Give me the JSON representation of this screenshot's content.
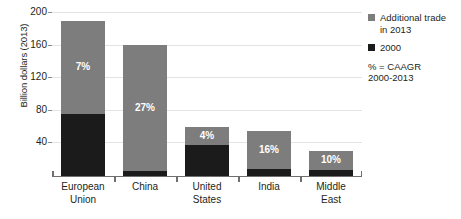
{
  "chart_data": {
    "type": "bar",
    "title": "",
    "xlabel": "",
    "ylabel": "Billion dollars (2013)",
    "ylim": [
      0,
      200
    ],
    "yticks": [
      40,
      80,
      120,
      160,
      200
    ],
    "grid": true,
    "stacked": true,
    "legend_position": "right",
    "categories": [
      "European Union",
      "China",
      "United States",
      "India",
      "Middle East"
    ],
    "series": [
      {
        "name": "2000",
        "color": "#1b1b1b",
        "values": [
          76,
          5,
          38,
          8,
          7
        ]
      },
      {
        "name": "Additional trade in 2013",
        "color": "#7d7d7d",
        "values": [
          114,
          155,
          22,
          47,
          23
        ]
      }
    ],
    "totals": [
      190,
      160,
      60,
      55,
      30
    ],
    "annotations": [
      "7%",
      "27%",
      "4%",
      "16%",
      "10%"
    ],
    "annotation_note": "% = CAAGR 2000-2013"
  },
  "axis": {
    "ylabel": "Billion dollars (2013)",
    "yticks": [
      {
        "value": 200,
        "label": "200"
      },
      {
        "value": 160,
        "label": "160"
      },
      {
        "value": 120,
        "label": "120"
      },
      {
        "value": 80,
        "label": "80"
      },
      {
        "value": 40,
        "label": "40"
      }
    ],
    "categories": [
      {
        "line1": "European",
        "line2": "Union"
      },
      {
        "line1": "China",
        "line2": ""
      },
      {
        "line1": "United",
        "line2": "States"
      },
      {
        "line1": "India",
        "line2": ""
      },
      {
        "line1": "Middle",
        "line2": "East"
      }
    ]
  },
  "bars": [
    {
      "category": "European Union",
      "total": 190,
      "base": 76,
      "top": 114,
      "pct": "7%"
    },
    {
      "category": "China",
      "total": 160,
      "base": 5,
      "top": 155,
      "pct": "27%"
    },
    {
      "category": "United States",
      "total": 60,
      "base": 38,
      "top": 22,
      "pct": "4%"
    },
    {
      "category": "India",
      "total": 55,
      "base": 8,
      "top": 47,
      "pct": "16%"
    },
    {
      "category": "Middle East",
      "total": 30,
      "base": 7,
      "top": 23,
      "pct": "10%"
    }
  ],
  "legend": {
    "items": [
      {
        "label_line1": "Additional trade",
        "label_line2": "in 2013",
        "color": "#7d7d7d"
      },
      {
        "label_line1": "2000",
        "label_line2": "",
        "color": "#1b1b1b"
      }
    ],
    "note_line1": "% = CAAGR",
    "note_line2": "2000-2013"
  },
  "colors": {
    "series_2000": "#1b1b1b",
    "series_additional": "#7d7d7d",
    "gridline": "#e3e3e3",
    "axis": "#6f6f6f",
    "text": "#231f20"
  }
}
